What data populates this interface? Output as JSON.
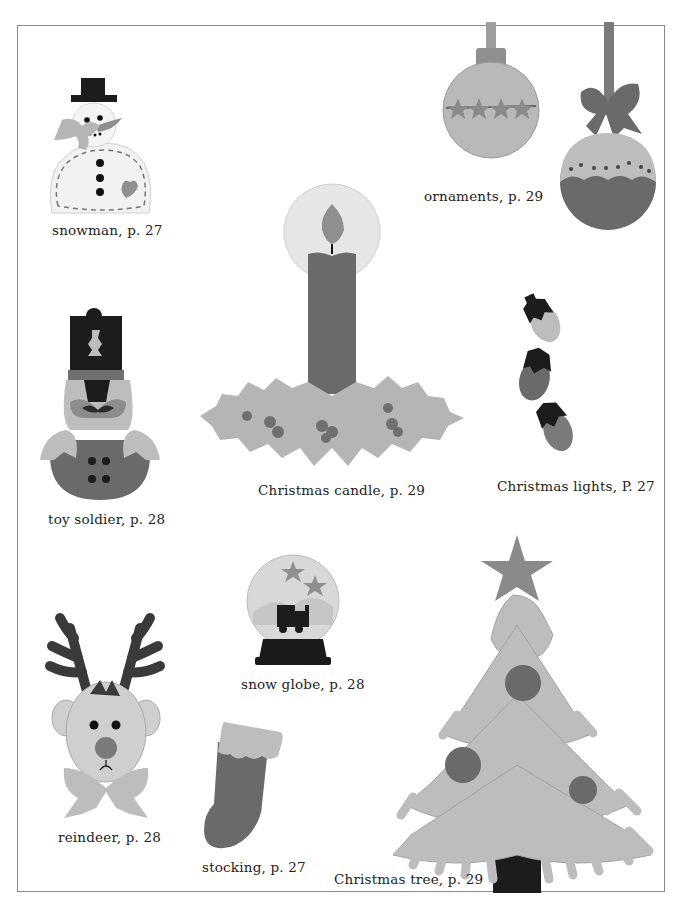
{
  "page": {
    "type": "craft-book page (grayscale scan)",
    "colors": {
      "background": "#ffffff",
      "frame_border": "#8a8a8a",
      "light_gray": "#bdbdbd",
      "mid_gray": "#8f8f8f",
      "dark_gray": "#5e5e5e",
      "black": "#1a1a1a",
      "caption_text": "#222222"
    }
  },
  "items": {
    "snowman": {
      "caption": "snowman, p. 27",
      "icon": "snowman-icon"
    },
    "ornaments": {
      "caption": "ornaments, p. 29",
      "icon": "ornament-icon"
    },
    "candle": {
      "caption": "Christmas candle, p. 29",
      "icon": "candle-icon"
    },
    "toy_soldier": {
      "caption": "toy soldier, p. 28",
      "icon": "toy-soldier-icon"
    },
    "lights": {
      "caption": "Christmas lights, P. 27",
      "icon": "light-bulb-icon"
    },
    "snow_globe": {
      "caption": "snow globe, p. 28",
      "icon": "snow-globe-icon"
    },
    "reindeer": {
      "caption": "reindeer, p. 28",
      "icon": "reindeer-icon"
    },
    "stocking": {
      "caption": "stocking, p. 27",
      "icon": "stocking-icon"
    },
    "tree": {
      "caption": "Christmas tree, p. 29",
      "icon": "christmas-tree-icon"
    }
  }
}
